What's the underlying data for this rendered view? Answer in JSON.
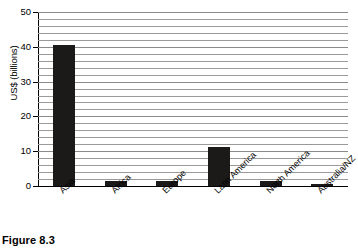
{
  "figure": {
    "caption": "Figure 8.3"
  },
  "chart_data": {
    "type": "bar",
    "title": "",
    "xlabel": "",
    "ylabel": "US$ (billions)",
    "categories": [
      "Asia",
      "Africa",
      "Europe",
      "Latin America",
      "North America",
      "Australia/NZ"
    ],
    "values": [
      40.5,
      1.5,
      1.5,
      11.3,
      1.3,
      0.7
    ],
    "series": [
      {
        "name": "US$ (billions)",
        "values": [
          40.5,
          1.5,
          1.5,
          11.3,
          1.3,
          0.7
        ]
      }
    ],
    "ylim": [
      0,
      50
    ],
    "ytick_labels": [
      "0",
      "10",
      "20",
      "30",
      "40",
      "50"
    ],
    "ytick_values": [
      0,
      10,
      20,
      30,
      40,
      50
    ],
    "gridline_interval": 2,
    "grid": true,
    "grid_axis": "y",
    "legend": false,
    "legend_position": "none",
    "bar_color": "#1c1a19",
    "grid_color": "#9a9a9a",
    "axis_color": "#000000",
    "background_color": "#ffffff",
    "xlabel_rotation": -45
  }
}
